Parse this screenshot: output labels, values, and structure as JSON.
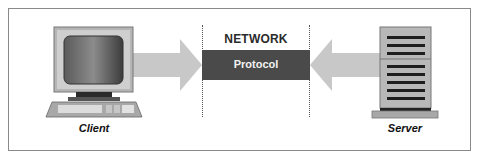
{
  "diagram": {
    "type": "client-server network protocol",
    "client": {
      "label": "Client",
      "icon": "desktop-computer-icon"
    },
    "server": {
      "label": "Server",
      "icon": "server-tower-icon"
    },
    "network": {
      "title": "NETWORK",
      "band_label": "Protocol"
    },
    "arrows": [
      {
        "from": "client",
        "to": "network",
        "direction": "right"
      },
      {
        "from": "server",
        "to": "network",
        "direction": "left"
      }
    ],
    "colors": {
      "frame": "#8a8a8a",
      "arrow": "#c8c8c8",
      "band": "#4a4a4a",
      "band_text": "#f2f2f2",
      "title_text": "#2b2b2b"
    }
  }
}
